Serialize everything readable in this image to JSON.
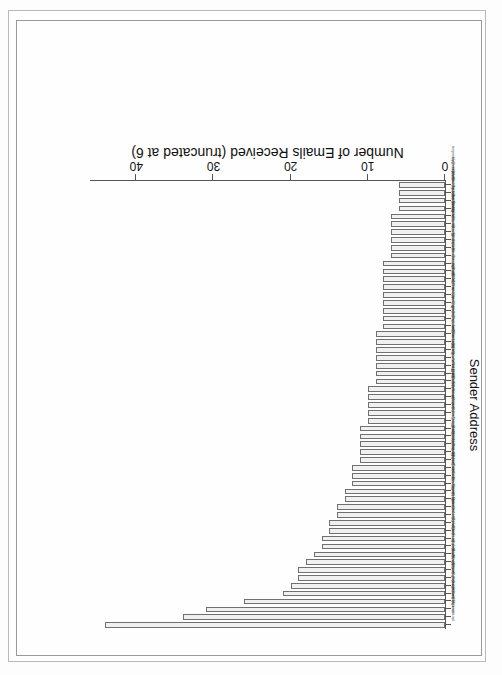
{
  "figure": {
    "axis_title_x": "Number of Emails Received (truncated at 6)",
    "axis_title_y": "Sender Address"
  },
  "chart_data": {
    "type": "bar",
    "orientation": "horizontal",
    "title": "",
    "xlabel": "Number of Emails Received (truncated at 6)",
    "ylabel": "Sender Address",
    "xlim": [
      0,
      46
    ],
    "xticks": [
      0,
      10,
      20,
      30,
      40
    ],
    "xticklabels": [
      "0",
      "10",
      "20",
      "30",
      "40"
    ],
    "grid": false,
    "legend": null,
    "note": "Bar chart rendered upside-down (rotated 180 degrees) in the scanned page.",
    "categories": [
      "tim.one@comcast.net",
      "barnhome@black.net",
      "pudge@pairi.org",
      "guimo@canada.com",
      "jhylton@gmail.com",
      "akuchling@mems.com",
      "skip@pobox.com",
      "mwh@python.net",
      "bwarsaw@gmail.com",
      "dcjim@zope.com",
      "fdrake@acm.org",
      "gvanrossum@gmail.com",
      "loewis@infomatik.hu",
      "jeremy@alum.mit.edu",
      "nas@arctrix.com",
      "montanaro@gmail.com",
      "theller@python.net",
      "bckfnn@worldonline.dk",
      "jackjansen@mac.com",
      "rhettinger@gmail.com",
      "anthony@interlink.com",
      "goodger@python.org",
      "kbk@shore.net",
      "ping@zesty.ca",
      "doerwalter@sbox.net",
      "nnorwitz@gmail.com",
      "lemburg@egenix.com",
      "hoelzl@pythonware.com",
      "tim_one@email.msn.com",
      "ggg@python.net",
      "effbot@telia.com",
      "pje@telecommunity.com",
      "prescott@python.net",
      "nascheme@utoronto.ca",
      "lkcl@samba-tng.org",
      "sjoerd@acm.org",
      "gmcm@hypernet.com",
      "jim@interet.com",
      "paul@prescod.net",
      "mal@lemburg.com",
      "greg@cosc.canterbury.ac.nz",
      "db3l@fitlinxx.com",
      "thomas@xs4all.net",
      "arigo@tunes.org",
      "dubois@users.sf.net",
      "zooko@zooko.com",
      "just@letterror.com",
      "tismer@tismer.com",
      "michael.hudson@python.org",
      "stephen@xemacs.org",
      "bac@ocf.berkeley.edu",
      "tanzer@swing.co.at",
      "brett@python.org",
      "mhammond@skippinet.au",
      "jafo@tummy.com",
      "benjamin@python.org",
      "terry.reedy@verizon.net"
    ],
    "values": [
      44,
      34,
      31,
      26,
      21,
      20,
      19,
      19,
      18,
      17,
      16,
      16,
      15,
      15,
      14,
      14,
      13,
      13,
      12,
      12,
      12,
      11,
      11,
      11,
      11,
      11,
      10,
      10,
      10,
      10,
      10,
      9,
      9,
      9,
      9,
      9,
      9,
      9,
      8,
      8,
      8,
      8,
      8,
      8,
      8,
      8,
      8,
      7,
      7,
      7,
      7,
      7,
      7,
      6,
      6,
      6,
      6
    ]
  }
}
